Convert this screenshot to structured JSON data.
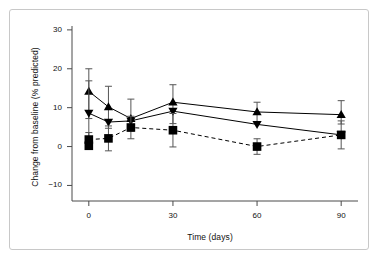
{
  "chart_data": {
    "type": "line",
    "title": "",
    "xlabel": "Time (days)",
    "ylabel": "Change from baseline (% predicted)",
    "xlim": [
      -6,
      96
    ],
    "ylim": [
      -14,
      31
    ],
    "xticks": [
      0,
      30,
      60,
      90
    ],
    "yticks": [
      -10,
      0,
      10,
      20,
      30
    ],
    "xtick_labels": [
      "0",
      "30",
      "60",
      "90"
    ],
    "ytick_labels": [
      "−10",
      "0",
      "10",
      "20",
      "30"
    ],
    "grid": false,
    "legend": "none",
    "series": [
      {
        "name": "up-triangle-series",
        "marker": "triangle-up",
        "linestyle": "solid",
        "color": "#000000",
        "x": [
          0,
          7,
          15,
          30,
          60,
          90
        ],
        "values": [
          14.2,
          10.2,
          7.2,
          11.4,
          8.9,
          8.2
        ],
        "err_low": [
          7.0,
          5.5,
          3.2,
          5.5,
          2.6,
          2.4
        ],
        "err_high": [
          5.8,
          5.3,
          5.0,
          4.5,
          2.5,
          3.6
        ]
      },
      {
        "name": "down-triangle-series",
        "marker": "triangle-down",
        "linestyle": "solid",
        "color": "#000000",
        "x": [
          0,
          7,
          15,
          30,
          60,
          90
        ],
        "values": [
          8.6,
          6.3,
          6.6,
          9.1,
          5.7,
          3.0
        ],
        "err_low": [
          8.3,
          0,
          0,
          0,
          0,
          0
        ],
        "err_high": [
          0,
          0,
          0,
          0,
          0,
          0
        ]
      },
      {
        "name": "square-series",
        "marker": "square",
        "linestyle": "dashed",
        "color": "#000000",
        "x": [
          0,
          7,
          15,
          30,
          60,
          90
        ],
        "values": [
          1.8,
          2.1,
          4.9,
          4.2,
          0.0,
          3.0
        ],
        "err_low": [
          1.8,
          3.2,
          2.9,
          4.3,
          2.0,
          3.6
        ],
        "err_high": [
          0,
          0,
          0,
          0,
          0,
          0
        ]
      },
      {
        "name": "square-series-baseline-extra",
        "marker": "square",
        "linestyle": "none",
        "color": "#000000",
        "x": [
          0
        ],
        "values": [
          0.2
        ],
        "err_low": [
          0
        ],
        "err_high": [
          0
        ]
      }
    ]
  }
}
